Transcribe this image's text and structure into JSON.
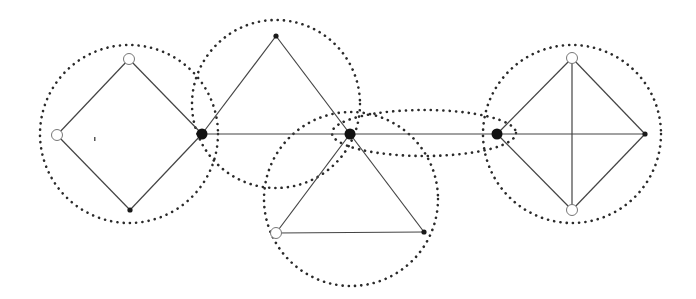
{
  "diagram": {
    "colors": {
      "edge": "#444444",
      "cluster": "#2a2a2a",
      "cut_vertex": "#111111",
      "open_vertex_fill": "#ffffff"
    },
    "nodes": [
      {
        "id": "a1",
        "x": 129,
        "y": 59,
        "type": "open"
      },
      {
        "id": "a2",
        "x": 57,
        "y": 135,
        "type": "open"
      },
      {
        "id": "a3",
        "x": 130,
        "y": 210,
        "type": "small"
      },
      {
        "id": "c1",
        "x": 202,
        "y": 134,
        "type": "cut"
      },
      {
        "id": "b1",
        "x": 276,
        "y": 36,
        "type": "small"
      },
      {
        "id": "c2",
        "x": 350,
        "y": 134,
        "type": "cut"
      },
      {
        "id": "d1",
        "x": 276,
        "y": 233,
        "type": "open"
      },
      {
        "id": "d2",
        "x": 424,
        "y": 232,
        "type": "small"
      },
      {
        "id": "c3",
        "x": 497,
        "y": 134,
        "type": "cut"
      },
      {
        "id": "e1",
        "x": 572,
        "y": 58,
        "type": "open"
      },
      {
        "id": "e2",
        "x": 572,
        "y": 210,
        "type": "open"
      },
      {
        "id": "e3",
        "x": 645,
        "y": 134,
        "type": "small"
      }
    ],
    "edges": [
      [
        "a1",
        "a2"
      ],
      [
        "a2",
        "a3"
      ],
      [
        "a3",
        "c1"
      ],
      [
        "c1",
        "a1"
      ],
      [
        "c1",
        "b1"
      ],
      [
        "b1",
        "c2"
      ],
      [
        "c1",
        "c2"
      ],
      [
        "c2",
        "d1"
      ],
      [
        "d1",
        "d2"
      ],
      [
        "d2",
        "c2"
      ],
      [
        "c2",
        "c3"
      ],
      [
        "c3",
        "e1"
      ],
      [
        "e1",
        "e3"
      ],
      [
        "e3",
        "e2"
      ],
      [
        "e2",
        "c3"
      ],
      [
        "c3",
        "e3"
      ],
      [
        "e1",
        "e2"
      ]
    ],
    "clusters": [
      {
        "id": "block-diamond-left",
        "shape": "circle",
        "cx": 129,
        "cy": 134,
        "r": 89
      },
      {
        "id": "block-triangle-top",
        "shape": "circle",
        "cx": 276,
        "cy": 104,
        "r": 84
      },
      {
        "id": "block-triangle-bottom",
        "shape": "circle",
        "cx": 351,
        "cy": 199,
        "r": 87
      },
      {
        "id": "block-bridge",
        "shape": "ellipse",
        "cx": 424,
        "cy": 133,
        "rx": 92,
        "ry": 23
      },
      {
        "id": "block-diamond-right",
        "shape": "circle",
        "cx": 572,
        "cy": 134,
        "r": 89
      }
    ],
    "artifact": {
      "x": 94,
      "y": 137
    }
  }
}
